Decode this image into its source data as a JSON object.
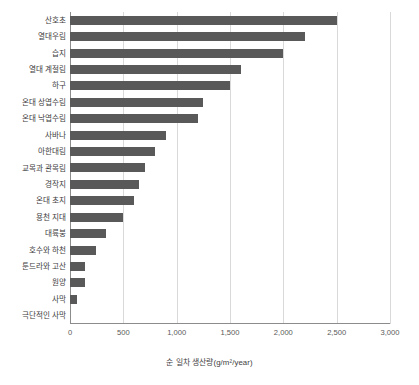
{
  "chart_data": {
    "type": "bar",
    "orientation": "horizontal",
    "title": "",
    "xlabel": "순 일차 생산량(g/m²/year)",
    "ylabel": "",
    "xlim": [
      0,
      3000
    ],
    "xticks": [
      "0",
      "500",
      "1,000",
      "1,500",
      "2,000",
      "2,500",
      "3,000"
    ],
    "xtick_values": [
      0,
      500,
      1000,
      1500,
      2000,
      2500,
      3000
    ],
    "grid": "vertical",
    "legend": "none",
    "bar_color": "#595959",
    "categories": [
      "산호초",
      "열대우림",
      "습지",
      "열대 계절림",
      "하구",
      "온대 상엽수림",
      "온대 낙엽수림",
      "사바나",
      "아한대림",
      "교목과 관목림",
      "경작지",
      "온대 초지",
      "용천 지대",
      "대륙붕",
      "호수와 하천",
      "툰드라와 고산",
      "원양",
      "사막",
      "극단적인 사막"
    ],
    "values": [
      2500,
      2200,
      2000,
      1600,
      1500,
      1250,
      1200,
      900,
      800,
      700,
      650,
      600,
      500,
      340,
      240,
      140,
      140,
      70,
      0
    ]
  }
}
